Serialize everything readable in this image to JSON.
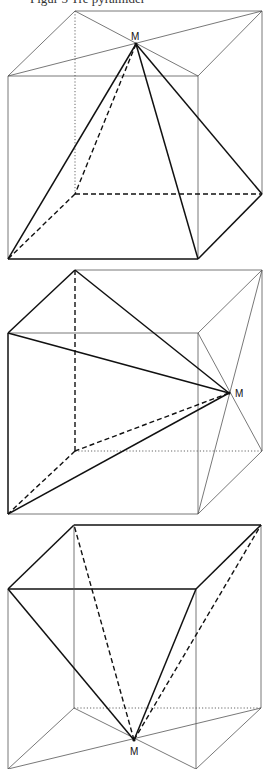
{
  "caption": "Figur 5  Tre pyramider",
  "colors": {
    "line": "#111111",
    "thin": "#555555"
  },
  "figures": [
    {
      "id": "cube-1",
      "apex_label": "M",
      "apex": [
        136,
        44
      ],
      "label_pos": [
        131,
        40
      ],
      "lines": [
        {
          "p": [
            [
              75,
              11
            ],
            [
              262,
              11
            ]
          ],
          "s": "thin"
        },
        {
          "p": [
            [
              75,
              11
            ],
            [
              8,
              76
            ]
          ],
          "s": "thin"
        },
        {
          "p": [
            [
              262,
              11
            ],
            [
              198,
              76
            ]
          ],
          "s": "thin"
        },
        {
          "p": [
            [
              8,
              76
            ],
            [
              198,
              76
            ]
          ],
          "s": "thin"
        },
        {
          "p": [
            [
              75,
              11
            ],
            [
              198,
              76
            ]
          ],
          "s": "thin"
        },
        {
          "p": [
            [
              262,
              11
            ],
            [
              8,
              76
            ]
          ],
          "s": "thin"
        },
        {
          "p": [
            [
              8,
              76
            ],
            [
              8,
              259
            ]
          ],
          "s": "thin"
        },
        {
          "p": [
            [
              198,
              76
            ],
            [
              198,
              259
            ]
          ],
          "s": "thin"
        },
        {
          "p": [
            [
              262,
              11
            ],
            [
              262,
              194
            ]
          ],
          "s": "thin"
        },
        {
          "p": [
            [
              75,
              11
            ],
            [
              75,
              194
            ]
          ],
          "s": "dotted"
        },
        {
          "p": [
            [
              8,
              259
            ],
            [
              198,
              259
            ]
          ],
          "s": "thick"
        },
        {
          "p": [
            [
              198,
              259
            ],
            [
              262,
              194
            ]
          ],
          "s": "thick"
        },
        {
          "p": [
            [
              75,
              194
            ],
            [
              262,
              194
            ]
          ],
          "s": "dashed"
        },
        {
          "p": [
            [
              75,
              194
            ],
            [
              8,
              259
            ]
          ],
          "s": "dashed"
        },
        {
          "p": [
            [
              136,
              44
            ],
            [
              8,
              259
            ]
          ],
          "s": "thick"
        },
        {
          "p": [
            [
              136,
              44
            ],
            [
              198,
              259
            ]
          ],
          "s": "thick"
        },
        {
          "p": [
            [
              136,
              44
            ],
            [
              262,
              194
            ]
          ],
          "s": "thick"
        },
        {
          "p": [
            [
              136,
              44
            ],
            [
              75,
              194
            ]
          ],
          "s": "dashed"
        }
      ]
    },
    {
      "id": "cube-2",
      "apex_label": "M",
      "apex": [
        229,
        393
      ],
      "label_pos": [
        235,
        397
      ],
      "lines": [
        {
          "p": [
            [
              75,
              270
            ],
            [
              262,
              270
            ]
          ],
          "s": "thin"
        },
        {
          "p": [
            [
              262,
              270
            ],
            [
              198,
              333
            ]
          ],
          "s": "thin"
        },
        {
          "p": [
            [
              8,
              333
            ],
            [
              198,
              333
            ]
          ],
          "s": "thin"
        },
        {
          "p": [
            [
              198,
              333
            ],
            [
              198,
              514
            ]
          ],
          "s": "thin"
        },
        {
          "p": [
            [
              262,
              270
            ],
            [
              262,
              451
            ]
          ],
          "s": "thin"
        },
        {
          "p": [
            [
              8,
              514
            ],
            [
              198,
              514
            ]
          ],
          "s": "thin"
        },
        {
          "p": [
            [
              198,
              514
            ],
            [
              262,
              451
            ]
          ],
          "s": "thin"
        },
        {
          "p": [
            [
              75,
              451
            ],
            [
              262,
              451
            ]
          ],
          "s": "dotted"
        },
        {
          "p": [
            [
              198,
              333
            ],
            [
              262,
              451
            ]
          ],
          "s": "thin"
        },
        {
          "p": [
            [
              262,
              270
            ],
            [
              198,
              514
            ]
          ],
          "s": "thin"
        },
        {
          "p": [
            [
              75,
              270
            ],
            [
              8,
              333
            ]
          ],
          "s": "thick"
        },
        {
          "p": [
            [
              8,
              333
            ],
            [
              8,
              514
            ]
          ],
          "s": "thick"
        },
        {
          "p": [
            [
              75,
              270
            ],
            [
              75,
              451
            ]
          ],
          "s": "dashed"
        },
        {
          "p": [
            [
              75,
              451
            ],
            [
              8,
              514
            ]
          ],
          "s": "dashed"
        },
        {
          "p": [
            [
              229,
              393
            ],
            [
              75,
              270
            ]
          ],
          "s": "thick"
        },
        {
          "p": [
            [
              229,
              393
            ],
            [
              8,
              333
            ]
          ],
          "s": "thick"
        },
        {
          "p": [
            [
              229,
              393
            ],
            [
              8,
              514
            ]
          ],
          "s": "thick"
        },
        {
          "p": [
            [
              229,
              393
            ],
            [
              75,
              451
            ]
          ],
          "s": "dashed"
        }
      ]
    },
    {
      "id": "cube-3",
      "apex_label": "M",
      "apex": [
        134,
        740
      ],
      "label_pos": [
        130,
        755
      ],
      "lines": [
        {
          "p": [
            [
              74,
              525
            ],
            [
              261,
              525
            ]
          ],
          "s": "thick"
        },
        {
          "p": [
            [
              74,
              525
            ],
            [
              8,
              589
            ]
          ],
          "s": "thick"
        },
        {
          "p": [
            [
              261,
              525
            ],
            [
              196,
              589
            ]
          ],
          "s": "thick"
        },
        {
          "p": [
            [
              8,
              589
            ],
            [
              196,
              589
            ]
          ],
          "s": "thick"
        },
        {
          "p": [
            [
              8,
              589
            ],
            [
              8,
              769
            ]
          ],
          "s": "thin"
        },
        {
          "p": [
            [
              196,
              589
            ],
            [
              196,
              769
            ]
          ],
          "s": "thin"
        },
        {
          "p": [
            [
              261,
              525
            ],
            [
              261,
              708
            ]
          ],
          "s": "thin"
        },
        {
          "p": [
            [
              74,
              525
            ],
            [
              74,
              708
            ]
          ],
          "s": "thin"
        },
        {
          "p": [
            [
              74,
              708
            ],
            [
              261,
              708
            ]
          ],
          "s": "dotted"
        },
        {
          "p": [
            [
              74,
              708
            ],
            [
              8,
              769
            ]
          ],
          "s": "thin"
        },
        {
          "p": [
            [
              261,
              708
            ],
            [
              196,
              769
            ]
          ],
          "s": "thin"
        },
        {
          "p": [
            [
              74,
              708
            ],
            [
              196,
              769
            ]
          ],
          "s": "thin"
        },
        {
          "p": [
            [
              261,
              708
            ],
            [
              8,
              769
            ]
          ],
          "s": "thin"
        },
        {
          "p": [
            [
              134,
              740
            ],
            [
              8,
              589
            ]
          ],
          "s": "thick"
        },
        {
          "p": [
            [
              134,
              740
            ],
            [
              196,
              589
            ]
          ],
          "s": "thick"
        },
        {
          "p": [
            [
              134,
              740
            ],
            [
              74,
              525
            ]
          ],
          "s": "dashed"
        },
        {
          "p": [
            [
              134,
              740
            ],
            [
              261,
              525
            ]
          ],
          "s": "dashed"
        }
      ]
    }
  ]
}
